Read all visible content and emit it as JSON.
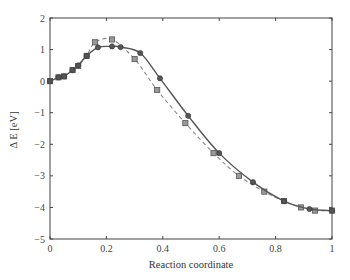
{
  "chart_data": {
    "type": "line",
    "title": "",
    "xlabel": "Reaction coordinate",
    "ylabel": "Δ E [eV]",
    "xlim": [
      0,
      1
    ],
    "ylim": [
      -5,
      2
    ],
    "xticks": [
      0,
      0.2,
      0.4,
      0.6,
      0.8,
      1
    ],
    "xtick_labels": [
      "0",
      "0.2",
      "0.4",
      "0.6",
      "0.8",
      "1"
    ],
    "yticks": [
      -5,
      -4,
      -3,
      -2,
      -1,
      0,
      1,
      2
    ],
    "ytick_labels": [
      "−5",
      "−4",
      "−3",
      "−2",
      "−1",
      "0",
      "1",
      "2"
    ],
    "grid": false,
    "legend": null,
    "series": [
      {
        "name": "circles (solid line)",
        "marker": "circle",
        "line_style": "solid",
        "color": "#555555",
        "x": [
          0,
          0.03,
          0.05,
          0.08,
          0.1,
          0.13,
          0.17,
          0.22,
          0.25,
          0.32,
          0.39,
          0.49,
          0.6,
          0.72,
          0.83,
          0.92,
          1.0
        ],
        "y": [
          0,
          0.12,
          0.15,
          0.35,
          0.5,
          0.8,
          1.07,
          1.1,
          1.08,
          0.89,
          0.09,
          -1.1,
          -2.28,
          -3.2,
          -3.8,
          -4.05,
          -4.1
        ]
      },
      {
        "name": "squares (dashed line)",
        "marker": "square",
        "line_style": "dashed",
        "color": "#888888",
        "x": [
          0,
          0.03,
          0.05,
          0.08,
          0.1,
          0.13,
          0.16,
          0.22,
          0.3,
          0.38,
          0.48,
          0.58,
          0.67,
          0.76,
          0.83,
          0.89,
          0.94,
          1.0
        ],
        "y": [
          0,
          0.12,
          0.15,
          0.35,
          0.48,
          0.8,
          1.23,
          1.32,
          0.7,
          -0.28,
          -1.33,
          -2.28,
          -3.0,
          -3.5,
          -3.8,
          -4.0,
          -4.1,
          -4.1
        ]
      }
    ]
  }
}
